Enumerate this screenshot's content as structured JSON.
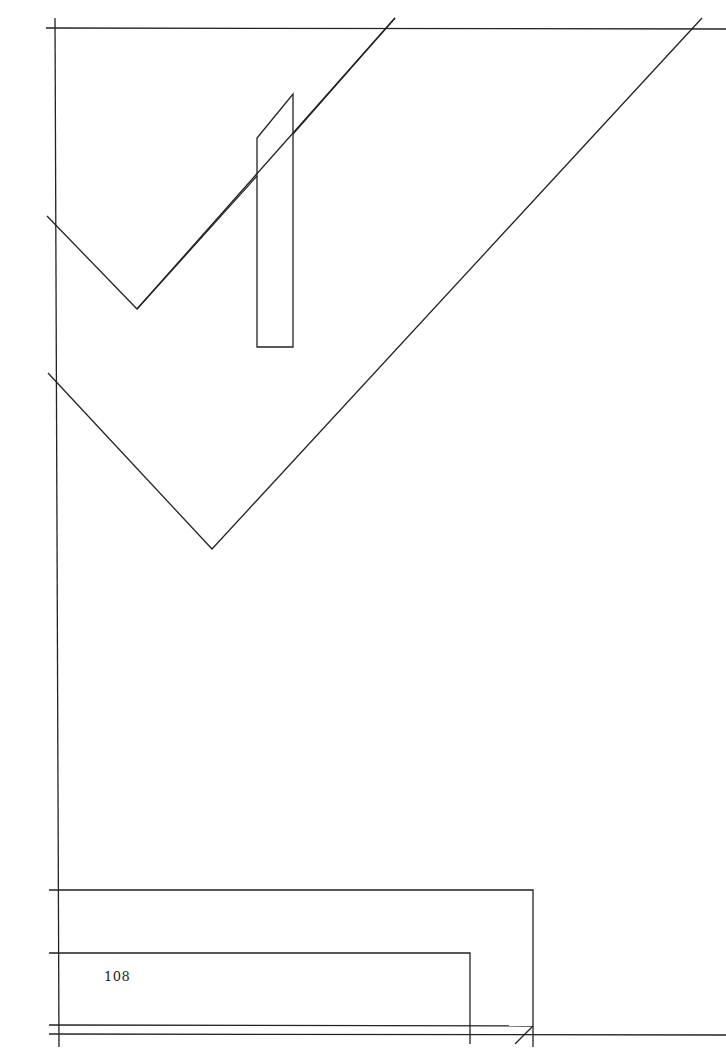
{
  "page": {
    "page_number": "108",
    "line_color": "#222222",
    "background": "#ffffff"
  },
  "drawing": {
    "description": "Line-art illustration: frame lines, two V-shaped chevrons, a slanted rectangular bar, and nested rectangular outlines at bottom"
  }
}
